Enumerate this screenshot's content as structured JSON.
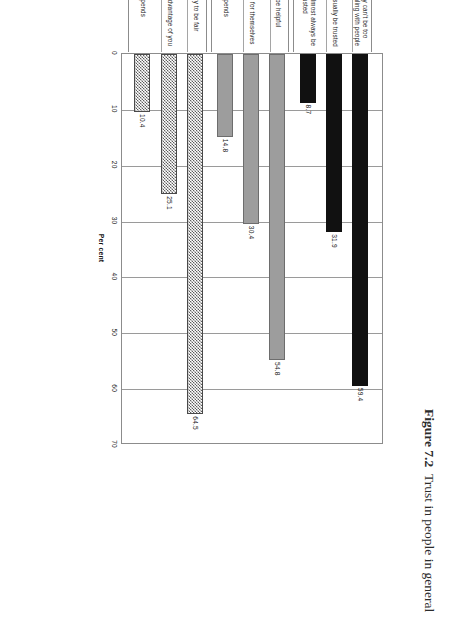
{
  "figure": {
    "number": "Figure 7.2",
    "caption": "Trust in people in general"
  },
  "chart_data": {
    "type": "bar",
    "orientation": "vertical-printed-rotated",
    "title": "",
    "xlabel": "",
    "ylabel": "Per cent",
    "ylim": [
      0,
      70
    ],
    "yticks": [
      "0",
      "10",
      "20",
      "30",
      "40",
      "50",
      "60",
      "70"
    ],
    "grid": true,
    "legend": "none",
    "groups": [
      {
        "name": "Trust",
        "fill": "solid-black",
        "items": [
          {
            "label": "You usually can't be too careful in dealing with people",
            "value": 59.4,
            "value_label": "59.4"
          },
          {
            "label": "People can usually be trusted",
            "value": 31.9,
            "value_label": "31.9"
          },
          {
            "label": "People can almost always be trusted",
            "value": 8.7,
            "value_label": "8.7"
          }
        ]
      },
      {
        "name": "Helpfulness",
        "fill": "solid-gray",
        "items": [
          {
            "label": "Try to be helpful",
            "value": 54.8,
            "value_label": "54.8"
          },
          {
            "label": "Just look out for themselves",
            "value": 30.4,
            "value_label": "30.4"
          },
          {
            "label": "Depends",
            "value": 14.8,
            "value_label": "14.8"
          }
        ]
      },
      {
        "name": "Fairness",
        "fill": "checker",
        "items": [
          {
            "label": "Would try to be fair",
            "value": 64.5,
            "value_label": "64.5"
          },
          {
            "label": "Would take advantage of you",
            "value": 25.1,
            "value_label": "25.1"
          },
          {
            "label": "Depends",
            "value": 10.4,
            "value_label": "10.4"
          }
        ]
      }
    ],
    "categories": [
      "You usually can't be too careful in dealing with people",
      "People can usually be trusted",
      "People can almost always be trusted",
      "Try to be helpful",
      "Just look out for themselves",
      "Depends",
      "Would try to be fair",
      "Would take advantage of you",
      "Depends"
    ],
    "values": [
      59.4,
      31.9,
      8.7,
      54.8,
      30.4,
      14.8,
      64.5,
      25.1,
      10.4
    ],
    "colors": {
      "trust": "#111111",
      "helpfulness": "#9d9d9d",
      "fairness": "#5e5e5e",
      "gridline": "#9a9a9a",
      "text": "#1a1a1a"
    }
  }
}
